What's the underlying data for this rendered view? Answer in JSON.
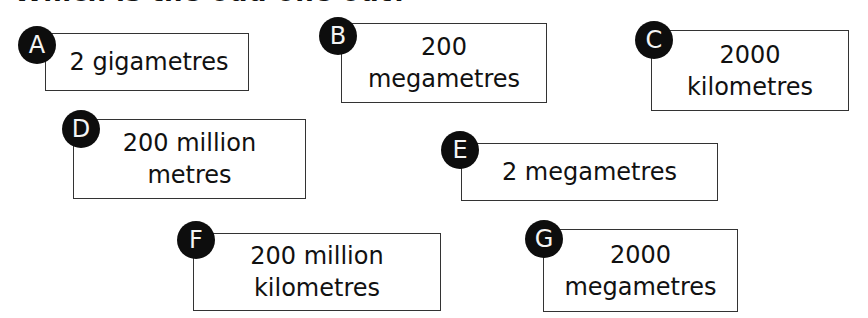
{
  "heading": "Which is the odd one out?",
  "cards": [
    {
      "letter": "A",
      "text": "2 gigametres"
    },
    {
      "letter": "B",
      "text": "200\nmegametres"
    },
    {
      "letter": "C",
      "text": "2000\nkilometres"
    },
    {
      "letter": "D",
      "text": "200 million\nmetres"
    },
    {
      "letter": "E",
      "text": "2 megametres"
    },
    {
      "letter": "F",
      "text": "200 million\nkilometres"
    },
    {
      "letter": "G",
      "text": "2000\nmegametres"
    }
  ]
}
